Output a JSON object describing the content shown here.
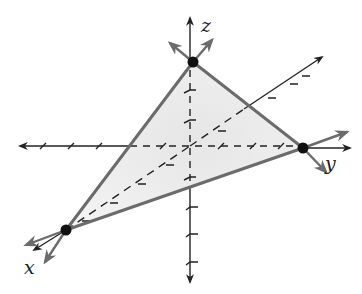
{
  "diagram": {
    "type": "3d-coordinate-plane-triangle",
    "axes": {
      "x": {
        "label": "x"
      },
      "y": {
        "label": "y"
      },
      "z": {
        "label": "z"
      }
    },
    "vertices": [
      {
        "name": "z-intercept",
        "axis": "z"
      },
      {
        "name": "y-intercept",
        "axis": "y"
      },
      {
        "name": "x-intercept",
        "axis": "x"
      }
    ],
    "colors": {
      "axis": "#222222",
      "triangle_edge": "#6b6b6b",
      "triangle_fill": "#ececec",
      "vertex": "#111111"
    }
  }
}
